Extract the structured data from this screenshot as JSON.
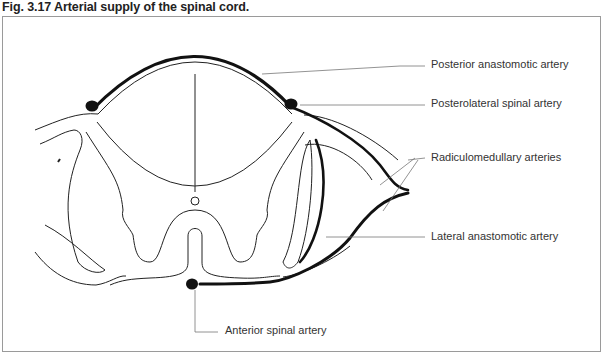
{
  "figure": {
    "caption": "Fig. 3.17  Arterial supply of the spinal cord.",
    "labels": [
      {
        "id": "posterior-anastomotic",
        "text": "Posterior anastomotic artery"
      },
      {
        "id": "posterolateral-spinal",
        "text": "Posterolateral spinal artery"
      },
      {
        "id": "radiculomedullary",
        "text": "Radiculomedullary arteries"
      },
      {
        "id": "lateral-anastomotic",
        "text": "Lateral anastomotic artery"
      },
      {
        "id": "anterior-spinal",
        "text": "Anterior spinal artery"
      }
    ],
    "colors": {
      "artery": "#111111",
      "outline": "#222222",
      "leader": "#777777",
      "frame": "#9a9a9a"
    }
  }
}
